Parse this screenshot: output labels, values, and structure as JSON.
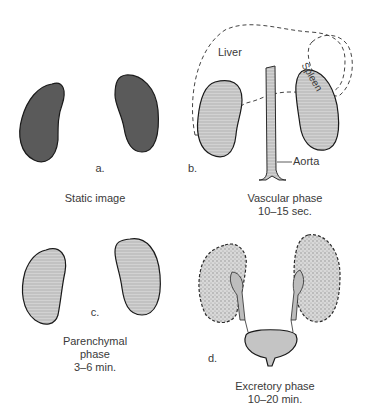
{
  "panels": {
    "a": {
      "letter": "a.",
      "caption": "Static image"
    },
    "b": {
      "letter": "b.",
      "caption_line1": "Vascular phase",
      "caption_line2": "10–15 sec.",
      "labels": {
        "liver": "Liver",
        "spleen": "Spleen",
        "aorta": "Aorta"
      }
    },
    "c": {
      "letter": "c.",
      "caption_line1": "Parenchymal",
      "caption_line2": "phase",
      "caption_line3": "3–6 min."
    },
    "d": {
      "letter": "d.",
      "caption_line1": "Excretory phase",
      "caption_line2": "10–20 min."
    }
  },
  "colors": {
    "static_kidney": "#5a5a5a",
    "light_kidney": "#c4c4c4",
    "outline": "#222222",
    "text": "#3a3a3a"
  }
}
